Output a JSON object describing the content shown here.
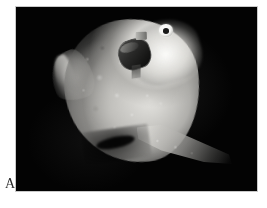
{
  "figure": {
    "panel_label": "A",
    "caption_text": "",
    "scene_description": "Ocean sunfish photographed against black water with an attached electronic tag near the head",
    "background_color": "#000000",
    "page_background_color": "#ffffff",
    "frame_border_color": "#c9c9c9",
    "label_color": "#2b2b2b"
  },
  "photo": {
    "name": "sunfish-photograph",
    "frame": {
      "left": 15,
      "top": 6,
      "width": 243,
      "height": 186
    },
    "elements": {
      "body": "fish-body",
      "head": "fish-head",
      "eye": "fish-eye",
      "pupil": "fish-pupil",
      "dorsal_fin": "fin-dorsal",
      "anal_fin": "fin-anal",
      "tag": "satellite-tag",
      "tag_antenna": "tag-antenna"
    },
    "tones": {
      "highlight": "#fcfcfa",
      "midtone": "#b0afab",
      "shadow": "#3a3a39",
      "black": "#030303",
      "tag_dark": "#151514",
      "tag_light": "#b9b9b5"
    }
  }
}
